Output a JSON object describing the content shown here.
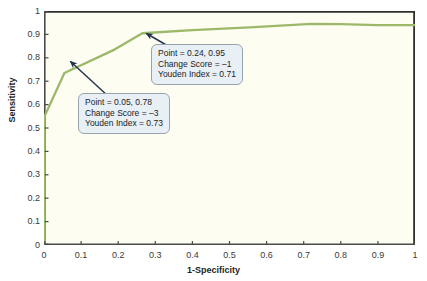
{
  "chart_data": {
    "type": "line",
    "title": "",
    "subtitle": "",
    "xlabel": "1-Specificity",
    "ylabel": "Sensitivity",
    "xlim": [
      0,
      1
    ],
    "ylim": [
      0,
      1
    ],
    "grid": false,
    "legend": null,
    "xticks": [
      "0",
      "0.1",
      "0.2",
      "0.3",
      "0.4",
      "0.5",
      "0.6",
      "0.7",
      "0.8",
      "0.9",
      "1"
    ],
    "yticks": [
      "0",
      "0.1",
      "0.2",
      "0.3",
      "0.4",
      "0.5",
      "0.6",
      "0.7",
      "0.8",
      "0.9",
      "1"
    ],
    "xtick_values": [
      0,
      0.1,
      0.2,
      0.3,
      0.4,
      0.5,
      0.6,
      0.7,
      0.8,
      0.9,
      1
    ],
    "ytick_values": [
      0,
      0.1,
      0.2,
      0.3,
      0.4,
      0.5,
      0.6,
      0.7,
      0.8,
      0.9,
      1
    ],
    "series": [
      {
        "name": "ROC curve",
        "color": "#9cb96a",
        "x": [
          0,
          0,
          0.055,
          0.19,
          0.265,
          0.4,
          0.555,
          0.72,
          0.8,
          0.9,
          1.0
        ],
        "y": [
          0,
          0.545,
          0.735,
          0.835,
          0.905,
          0.918,
          0.93,
          0.945,
          0.944,
          0.94,
          0.94
        ]
      }
    ],
    "annotations": [
      {
        "id": "annotation-high",
        "lines": [
          "Point = 0.24, 0.95",
          "Change Score = –1",
          "Youden Index = 0.71"
        ],
        "point_label": "Point = 0.24, 0.95",
        "change_score_label": "Change Score = –1",
        "youden_index_label": "Youden Index = 0.71",
        "point_x": 0.265,
        "point_y": 0.905
      },
      {
        "id": "annotation-low",
        "lines": [
          "Point = 0.05, 0.78",
          "Change Score = –3",
          "Youden Index = 0.73"
        ],
        "point_label": "Point = 0.05, 0.78",
        "change_score_label": "Change Score = –3",
        "youden_index_label": "Youden Index = 0.73",
        "point_x": 0.055,
        "point_y": 0.735
      }
    ]
  },
  "colors": {
    "curve": "#9cb96a",
    "plot_background": "#fdfdf2",
    "frame": "#2f2f2f",
    "callout_fill": "#e8eff5",
    "callout_border": "#97a3ad",
    "arrow": "#27344f",
    "tick_text": "#3a3a3a",
    "axis_title": "#231f20",
    "page_background": "#ffffff"
  }
}
